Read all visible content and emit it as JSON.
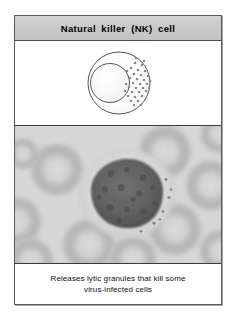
{
  "figure": {
    "title": "Natural  killer  (NK)  cell",
    "caption_line1": "Releases lytic granules that kill some",
    "caption_line2": "virus-infected cells"
  },
  "diagram": {
    "label_cell_membrane": "cell-membrane-outline",
    "label_nucleus": "nucleus-outline",
    "label_granules": "lytic-granules",
    "granule_count": 34,
    "colors": {
      "outline": "#555555",
      "cytoplasm": "#fbfbfb",
      "nucleus_fill": "#f4f4f4",
      "granule": "#8d8d8d"
    }
  },
  "micrograph": {
    "label": "blood-smear-micrograph",
    "description": "Grayscale blood smear showing a large mononuclear lymphocyte surrounded by erythrocytes",
    "colors": {
      "background": "#d6d6d6",
      "rbc_body": "#c2c2c2",
      "rbc_rim": "#a8a8a8",
      "cytoplasm": "#dcdcdc",
      "nucleus": "#616161",
      "nucleus_dark": "#4e4e4e"
    },
    "red_blood_cells": [
      {
        "cx": 42,
        "cy": 44,
        "r": 27
      },
      {
        "cx": 2,
        "cy": 96,
        "r": 25
      },
      {
        "cx": 150,
        "cy": 26,
        "r": 27
      },
      {
        "cx": 196,
        "cy": 60,
        "r": 26
      },
      {
        "cx": 205,
        "cy": 8,
        "r": 20
      },
      {
        "cx": 160,
        "cy": 104,
        "r": 27
      },
      {
        "cx": 74,
        "cy": 120,
        "r": 27
      },
      {
        "cx": 16,
        "cy": 136,
        "r": 23
      },
      {
        "cx": 206,
        "cy": 126,
        "r": 22
      },
      {
        "cx": 118,
        "cy": 134,
        "r": 24
      }
    ],
    "leukocyte": {
      "cx": 112,
      "cy": 68,
      "cytoplasm_rx": 48,
      "cytoplasm_ry": 45,
      "nucleus_rx": 36,
      "nucleus_ry": 35
    }
  }
}
